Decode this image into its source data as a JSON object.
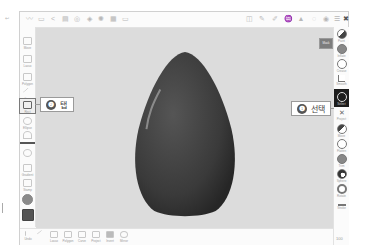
{
  "top_toolbar": {
    "left_icons": [
      "brush-icon",
      "layers-icon",
      "share-icon",
      "document-icon",
      "settings-icon",
      "symmetry-icon",
      "light-icon",
      "grid-icon",
      "ruler-icon"
    ],
    "right_icons": [
      "undo-history-icon",
      "pen-icon",
      "pencil-icon",
      "smooth-icon",
      "flatten-icon",
      "mask-icon",
      "visibility-icon",
      "layers-list-icon",
      "more-icon"
    ],
    "fold_glyph": "↩"
  },
  "left_toolbar": {
    "items": [
      {
        "name": "brush",
        "label": "Move"
      },
      {
        "name": "scale",
        "label": "Lasso"
      },
      {
        "name": "polygon",
        "label": "Polygon"
      },
      {
        "name": "line",
        "label": "Line"
      },
      {
        "name": "rect",
        "label": "Rect",
        "selected": true
      },
      {
        "name": "ellipse",
        "label": "Ellipse"
      },
      {
        "name": "curve",
        "label": ""
      },
      {
        "name": "transform",
        "label": ""
      },
      {
        "name": "gradient",
        "label": "Gradient"
      },
      {
        "name": "stamp",
        "label": "Stamp"
      },
      {
        "name": "material",
        "label": ""
      },
      {
        "name": "color",
        "label": ""
      }
    ]
  },
  "right_toolbar": {
    "items": [
      {
        "name": "paint",
        "label": "Paint"
      },
      {
        "name": "inflate",
        "label": "Inflate"
      },
      {
        "name": "crease",
        "label": "Crease"
      },
      {
        "name": "smooth",
        "label": "Smooth"
      },
      {
        "name": "selected-tool",
        "label": "Select",
        "selected": true
      },
      {
        "name": "pinch",
        "label": "Project"
      },
      {
        "name": "move",
        "label": "Move"
      },
      {
        "name": "flatten",
        "label": "Flatten"
      },
      {
        "name": "trim",
        "label": "Trim"
      },
      {
        "name": "sphere",
        "label": "Sphere"
      },
      {
        "name": "rotate",
        "label": "Rotate"
      },
      {
        "name": "stroke",
        "label": "Stroke"
      }
    ],
    "zoom_label": "100"
  },
  "bottom_toolbar": {
    "items": [
      {
        "name": "undo",
        "label": "Undo"
      },
      {
        "name": "redo",
        "label": ""
      },
      {
        "name": "lasso",
        "label": "Lasso"
      },
      {
        "name": "polygon",
        "label": "Polygon"
      },
      {
        "name": "curve",
        "label": "Curve"
      },
      {
        "name": "project",
        "label": "Project"
      },
      {
        "name": "invert",
        "label": "Invert"
      },
      {
        "name": "mirror",
        "label": "Mirror"
      }
    ]
  },
  "canvas": {
    "background": "#dcdcdc",
    "object_color": "#3d3d3d",
    "badge_label": "Mask"
  },
  "callouts": [
    {
      "number": "❶",
      "text": "선택"
    },
    {
      "number": "❷",
      "text": "탭"
    }
  ]
}
